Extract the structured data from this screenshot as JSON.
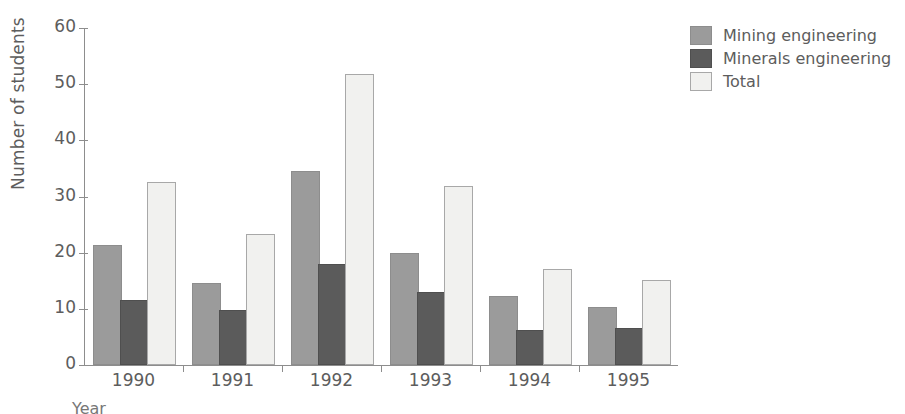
{
  "chart_data": {
    "type": "bar",
    "title": "",
    "xlabel": "Year",
    "ylabel": "Number of students",
    "categories": [
      "1990",
      "1991",
      "1992",
      "1993",
      "1994",
      "1995"
    ],
    "series": [
      {
        "name": "Mining engineering",
        "color": "#9b9b9b",
        "values": [
          21,
          14.2,
          34.2,
          19.5,
          12,
          10
        ]
      },
      {
        "name": "Minerals engineering",
        "color": "#5b5b5b",
        "values": [
          11.2,
          9.4,
          17.6,
          12.7,
          5.9,
          6.3
        ]
      },
      {
        "name": "Total",
        "color": "#f1f1ef",
        "values": [
          32.2,
          23,
          51.4,
          31.5,
          16.7,
          14.8
        ]
      }
    ],
    "ylim": [
      0,
      60
    ],
    "yticks": [
      0,
      10,
      20,
      30,
      40,
      50,
      60
    ],
    "ytick_labels": [
      "0",
      "10",
      "20",
      "30",
      "40",
      "50",
      "60"
    ],
    "grid": false,
    "legend_position": "top-right"
  },
  "legend": {
    "entries": [
      {
        "label": "Mining engineering"
      },
      {
        "label": "Minerals engineering"
      },
      {
        "label": "Total"
      }
    ]
  },
  "axes": {
    "y_title": "Number of students",
    "x_title": "Year"
  }
}
